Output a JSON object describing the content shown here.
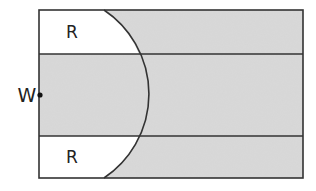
{
  "diagram": {
    "labels": {
      "top_region": "R",
      "bottom_region": "R",
      "point": "W"
    },
    "colors": {
      "shaded_fill": "#d9d9d9",
      "unshaded_fill": "#ffffff",
      "stroke": "#333333",
      "text": "#222222"
    },
    "geometry": {
      "rect": {
        "x": 39,
        "y": 10,
        "width": 264,
        "height": 168
      },
      "dividers_y": [
        54,
        136
      ],
      "arc": {
        "start": [
          104,
          10
        ],
        "end": [
          104,
          178
        ],
        "apex": [
          149,
          94
        ],
        "radius": 101
      },
      "point_W": [
        40,
        95
      ]
    }
  }
}
